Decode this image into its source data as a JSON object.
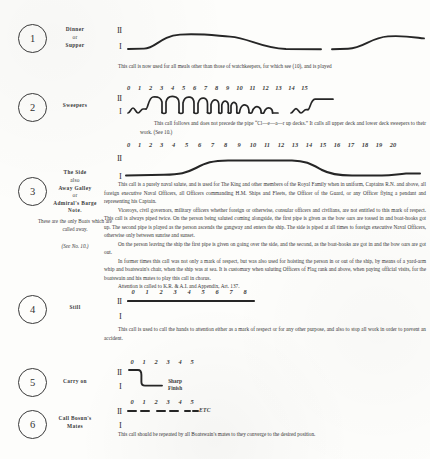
{
  "document": {
    "type": "naval-bosun-call-chart",
    "page_background": "#fdfdfb",
    "ink_color": "#333333"
  },
  "entries": [
    {
      "number": "1",
      "name_lines": [
        "Dinner",
        "or",
        "Supper"
      ],
      "stave_upper": "II",
      "stave_lower": "I",
      "ruler": [],
      "caption": "This call is now used for all meals other than those of watchkeepers, for which see (10), and is played"
    },
    {
      "number": "2",
      "name_lines": [
        "Sweepers"
      ],
      "stave_upper": "II",
      "stave_lower": "I",
      "ruler": [
        "0",
        "1",
        "2",
        "3",
        "4",
        "5",
        "6",
        "7",
        "8",
        "9",
        "10",
        "11",
        "12",
        "13",
        "14",
        "15"
      ],
      "caption": "This call follows and does not precede the pipe “Cl—e—a—r up decks.”  It calls all upper deck and lower deck sweepers to their work.  (See 10.)"
    },
    {
      "number": "3",
      "name_lines": [
        "The Side",
        "also",
        "Away Galley",
        "or",
        "Admiral's Barge"
      ],
      "note_heading": "Note.",
      "note_body": "These are the only Boats which are called away.",
      "see_ref": "(See No. 10.)",
      "stave_upper": "II",
      "stave_lower": "I",
      "ruler": [
        "0",
        "1",
        "2",
        "3",
        "4",
        "5",
        "6",
        "7",
        "8",
        "9",
        "10",
        "11",
        "12",
        "13",
        "14",
        "15",
        "16",
        "17",
        "18",
        "19",
        "20"
      ],
      "paragraphs": [
        "This call is a purely naval salute, and is used for The King and other members of the Royal Family when in uniform, Captains R.N. and above, all foreign executive Naval Officers, all Officers commanding H.M. Ships and Fleets, the Officer of the Guard, or any Officer flying a pendant and representing his Captain.",
        "Viceroys, civil governors, military officers whether foreign or otherwise, consular officers and civilians, are not entitled to this mark of respect.  This call is always piped twice.  On the person being saluted coming alongside, the first pipe is given as the bow oars are tossed in and boat-hooks got up.  The second pipe is played as the person ascends the gangway and enters the ship.  The side is piped at all times to foreign executive Naval Officers, otherwise only between sunrise and sunset.",
        "On the person leaving the ship the first pipe is given on going over the side, and the second, as the boat-hooks are got in and the bow oars are got out.",
        "In former times this call was not only a mark of respect, but was also used for hoisting the person in or out of the ship, by means of a yard-arm whip and boatswain's chair, when the ship was at sea.   It is customary when saluting Officers of Flag rank and above, when paying official visits, for the boatswain and his mates to play this call in chorus.",
        "Attention is called to K.R. & A.I. and Appendix, Art. 137."
      ]
    },
    {
      "number": "4",
      "name_lines": [
        "Still"
      ],
      "stave_upper": "II",
      "stave_lower": "I",
      "ruler": [
        "0",
        "1",
        "2",
        "3",
        "4",
        "5",
        "6",
        "7",
        "8"
      ],
      "caption": "This call is used to call the hands to attention either as a mark of respect or for any other purpose, and also to stop all work in order to prevent an accident."
    },
    {
      "number": "5",
      "name_lines": [
        "Carry on"
      ],
      "stave_upper": "II",
      "stave_lower": "I",
      "ruler": [
        "0",
        "1",
        "2",
        "3",
        "4",
        "5"
      ],
      "annotation_lines": [
        "Sharp",
        "Finish"
      ]
    },
    {
      "number": "6",
      "name_lines": [
        "Call Bosun's",
        "Mates"
      ],
      "stave_upper": "II",
      "stave_lower": "I",
      "ruler": [
        "0",
        "1",
        "2",
        "3",
        "4",
        "5"
      ],
      "etc_label": "ETC",
      "caption": "This call should be repeated by all Boatswain's mates to they converge to the desired position."
    }
  ]
}
